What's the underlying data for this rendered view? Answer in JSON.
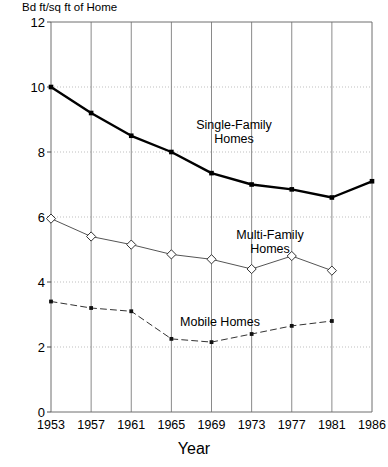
{
  "chart_data": {
    "type": "line",
    "title": "",
    "ylabel": "Bd ft/sq ft of Home",
    "xlabel": "Year",
    "categories": [
      "1953",
      "1957",
      "1961",
      "1965",
      "1969",
      "1973",
      "1977",
      "1981",
      "1986"
    ],
    "yticks": [
      "0",
      "2",
      "4",
      "6",
      "8",
      "10",
      "12"
    ],
    "ylim": [
      0,
      12
    ],
    "grid": "both",
    "legend": "annotations-on-plot",
    "series": [
      {
        "name": "Single-Family Homes",
        "marker": "filled-square",
        "line": "solid-thick",
        "color": "#000000",
        "values": [
          10.0,
          9.2,
          8.5,
          8.0,
          7.35,
          7.0,
          6.85,
          6.6,
          7.1
        ]
      },
      {
        "name": "Multi-Family Homes",
        "marker": "open-diamond",
        "line": "solid-thin",
        "color": "#555555",
        "values": [
          5.95,
          5.4,
          5.15,
          4.85,
          4.7,
          4.4,
          4.8,
          4.35,
          null
        ]
      },
      {
        "name": "Mobile Homes",
        "marker": "filled-square-small",
        "line": "dashed",
        "color": "#333333",
        "values": [
          3.4,
          3.2,
          3.1,
          2.25,
          2.15,
          2.4,
          2.65,
          2.8,
          null
        ]
      }
    ],
    "annotations": [
      {
        "text_line1": "Single-Family",
        "text_line2": "Homes"
      },
      {
        "text_line1": "Multi-Family",
        "text_line2": "Homes"
      },
      {
        "text_line1": "Mobile Homes",
        "text_line2": ""
      }
    ]
  }
}
